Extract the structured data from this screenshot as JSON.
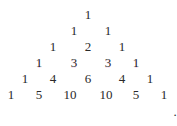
{
  "figure": {
    "rows": [
      {
        "values": [
          "1"
        ],
        "x": [
          88
        ],
        "y": 14
      },
      {
        "values": [
          "1",
          "1"
        ],
        "x": [
          74,
          108
        ],
        "y": 30
      },
      {
        "values": [
          "1",
          "2",
          "1"
        ],
        "x": [
          53,
          88,
          122
        ],
        "y": 46
      },
      {
        "values": [
          "1",
          "3",
          "3",
          "1"
        ],
        "x": [
          39,
          74,
          108,
          136
        ],
        "y": 62
      },
      {
        "values": [
          "1",
          "4",
          "6",
          "4",
          "1"
        ],
        "x": [
          25,
          53,
          88,
          122,
          150
        ],
        "y": 78
      },
      {
        "values": [
          "1",
          "5",
          "10",
          "10",
          "5",
          "1"
        ],
        "x": [
          11,
          39,
          70,
          106,
          136,
          164
        ],
        "y": 94
      }
    ],
    "trailing_punctuation": "."
  }
}
